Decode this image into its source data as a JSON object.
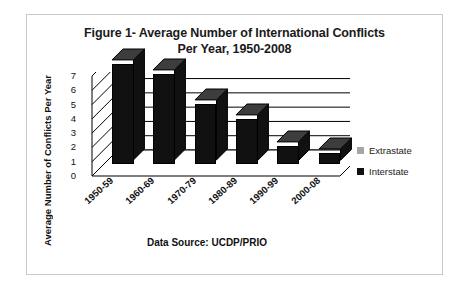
{
  "chart_data": {
    "type": "bar",
    "title": "Figure 1- Average Number of International Conflicts Per Year, 1950-2008",
    "title_line1": "Figure 1- Average Number of International Conflicts",
    "title_line2": "Per Year, 1950-2008",
    "xlabel": "",
    "ylabel": "Average Number of Conflicts Per Year",
    "categories": [
      "1950-59",
      "1960-69",
      "1970-79",
      "1980-89",
      "1990-99",
      "2000-08"
    ],
    "values": [
      7.0,
      6.3,
      4.2,
      3.2,
      1.3,
      0.8
    ],
    "ylim": [
      0,
      7
    ],
    "yticks": [
      0,
      1,
      2,
      3,
      4,
      5,
      6,
      7
    ],
    "ytick_labels": [
      "0",
      "1",
      "2",
      "3",
      "4",
      "5",
      "6",
      "7"
    ],
    "grid": true,
    "legend_position": "right",
    "series": [
      {
        "name": "Extrastate",
        "color": "#a6a6a6",
        "values": [
          0,
          0,
          0,
          0,
          0,
          0
        ]
      },
      {
        "name": "Interstate",
        "color": "#111111",
        "values": [
          7.0,
          6.3,
          4.2,
          3.2,
          1.3,
          0.8
        ]
      }
    ],
    "annotations": [
      "Data Source: UCDP/PRIO"
    ]
  },
  "legend": {
    "entries": [
      {
        "label": "Extrastate",
        "color": "#a6a6a6"
      },
      {
        "label": "Interstate",
        "color": "#111111"
      }
    ]
  },
  "caption": {
    "data_source": "Data Source:  UCDP/PRIO"
  },
  "colors": {
    "bar": "#111111",
    "bar_top": "#3d3d3d",
    "frame": "#c9c9c9",
    "grid": "#000000",
    "extrastate": "#a6a6a6"
  }
}
